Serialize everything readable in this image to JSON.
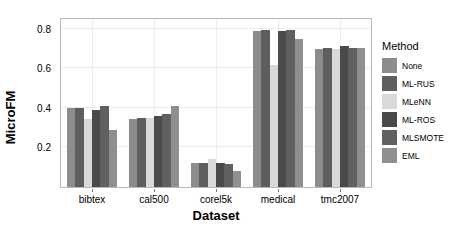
{
  "chart_data": {
    "type": "bar",
    "title": "",
    "xlabel": "Dataset",
    "ylabel": "MicroFM",
    "categories": [
      "bibtex",
      "cal500",
      "corel5k",
      "medical",
      "tmc2007"
    ],
    "ylim": [
      0,
      0.85
    ],
    "yticks": [
      0.2,
      0.4,
      0.6,
      0.8
    ],
    "ytick_labels": [
      "0.2",
      "0.4",
      "0.6",
      "0.8"
    ],
    "grid": true,
    "legend_position": "right",
    "legend_title": "Method",
    "series": [
      {
        "name": "None",
        "color": "#8c8c8c",
        "values": [
          0.4,
          0.345,
          0.12,
          0.79,
          0.7
        ]
      },
      {
        "name": "ML-RUS",
        "color": "#5e5e5e",
        "values": [
          0.4,
          0.35,
          0.122,
          0.795,
          0.705
        ]
      },
      {
        "name": "MLeNN",
        "color": "#d9d9d9",
        "values": [
          0.345,
          0.35,
          0.14,
          0.615,
          0.7
        ]
      },
      {
        "name": "ML-ROS",
        "color": "#4a4a4a",
        "values": [
          0.39,
          0.36,
          0.12,
          0.79,
          0.715
        ]
      },
      {
        "name": "MLSMOTE",
        "color": "#606060",
        "values": [
          0.41,
          0.37,
          0.118,
          0.795,
          0.705
        ]
      },
      {
        "name": "EML",
        "color": "#8f8f8f",
        "values": [
          0.29,
          0.41,
          0.08,
          0.75,
          0.705
        ]
      }
    ]
  },
  "legend": {
    "title": "Method",
    "items": [
      {
        "label": "None",
        "color": "#8c8c8c"
      },
      {
        "label": "ML-RUS",
        "color": "#5e5e5e"
      },
      {
        "label": "MLeNN",
        "color": "#d9d9d9"
      },
      {
        "label": "ML-ROS",
        "color": "#4a4a4a"
      },
      {
        "label": "MLSMOTE",
        "color": "#606060"
      },
      {
        "label": "EML",
        "color": "#8f8f8f"
      }
    ]
  },
  "axes": {
    "y_title": "MicroFM",
    "x_title": "Dataset"
  }
}
